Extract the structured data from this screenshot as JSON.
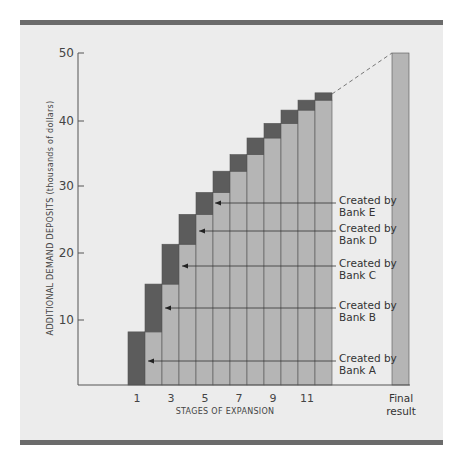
{
  "chart_data": {
    "type": "bar",
    "subtype": "stacked-step",
    "title": "",
    "xlabel": "STAGES OF EXPANSION",
    "ylabel": "ADDITIONAL DEMAND DEPOSITS (thousands of dollars)",
    "ylim": [
      0,
      50
    ],
    "yticks": [
      10,
      20,
      30,
      40,
      50
    ],
    "xtick_labels": [
      "1",
      "3",
      "5",
      "7",
      "9",
      "11"
    ],
    "categories": [
      "1",
      "2",
      "3",
      "4",
      "5",
      "6",
      "7",
      "8",
      "9",
      "10",
      "11",
      "12",
      "Final result"
    ],
    "cumulative_totals": [
      8,
      15.2,
      21.2,
      25.7,
      29,
      32.2,
      34.7,
      37.2,
      39.4,
      41.4,
      42.9,
      44,
      50
    ],
    "series": [
      {
        "name": "Previously created deposits",
        "color": "#b5b5b5",
        "values": [
          0,
          8,
          15.2,
          21.2,
          25.7,
          29,
          32.2,
          34.7,
          37.2,
          39.4,
          41.4,
          42.9,
          50
        ]
      },
      {
        "name": "New deposits created at this stage",
        "color": "#5c5c5c",
        "values": [
          8,
          7.2,
          6,
          4.5,
          3.3,
          3.2,
          2.5,
          2.5,
          2.2,
          2,
          1.5,
          1.1,
          0
        ]
      }
    ],
    "final_result": 50,
    "annotations": [
      {
        "text": [
          "Created by",
          "Bank A"
        ],
        "target_stage": 1
      },
      {
        "text": [
          "Created by",
          "Bank B"
        ],
        "target_stage": 2
      },
      {
        "text": [
          "Created by",
          "Bank C"
        ],
        "target_stage": 3
      },
      {
        "text": [
          "Created by",
          "Bank D"
        ],
        "target_stage": 4
      },
      {
        "text": [
          "Created by",
          "Bank E"
        ],
        "target_stage": 5
      }
    ],
    "dashed_line": "from top of stage 12 to top of Final result",
    "grid": false,
    "legend": "none"
  },
  "labels": {
    "y_axis_title": "ADDITIONAL DEMAND DEPOSITS (thousands of dollars)",
    "x_axis_title": "STAGES OF EXPANSION",
    "final_label_1": "Final",
    "final_label_2": "result",
    "y_ticks": [
      "10",
      "20",
      "30",
      "40",
      "50"
    ],
    "x_ticks": [
      "1",
      "3",
      "5",
      "7",
      "9",
      "11"
    ],
    "bank_a_1": "Created by",
    "bank_a_2": "Bank A",
    "bank_b_1": "Created by",
    "bank_b_2": "Bank B",
    "bank_c_1": "Created by",
    "bank_c_2": "Bank C",
    "bank_d_1": "Created by",
    "bank_d_2": "Bank D",
    "bank_e_1": "Created by",
    "bank_e_2": "Bank E"
  },
  "colors": {
    "panel_bg": "#ececec",
    "rule": "#6b6b6b",
    "dark_bar": "#5c5c5c",
    "light_bar": "#b5b5b5",
    "axis": "#555555"
  }
}
